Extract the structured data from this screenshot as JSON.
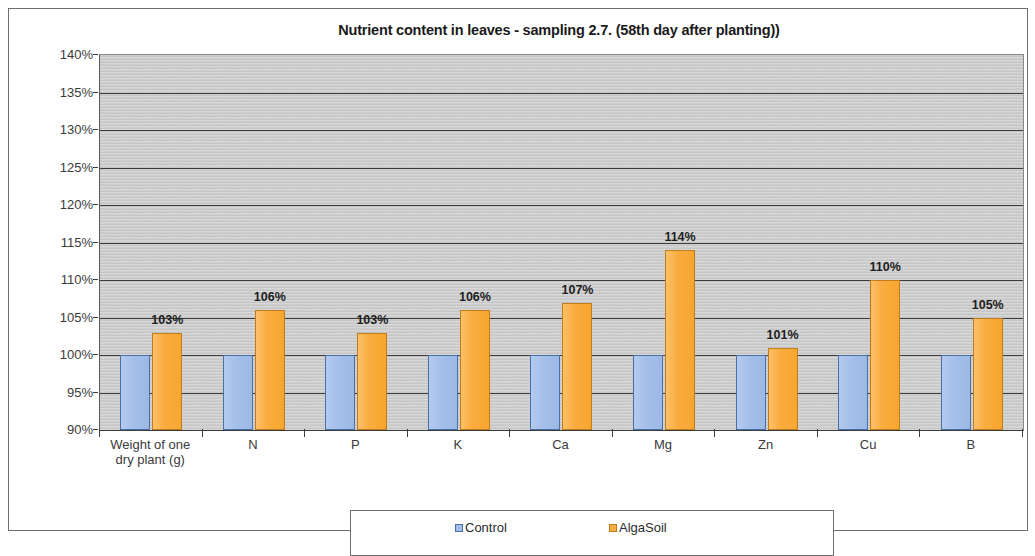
{
  "chart_data": {
    "type": "bar",
    "title": "Nutrient content in leaves - sampling 2.7. (58th day after planting))",
    "xlabel": "",
    "ylabel": "",
    "ylim": [
      90,
      140
    ],
    "ytick_labels": [
      "140%",
      "135%",
      "130%",
      "125%",
      "120%",
      "115%",
      "110%",
      "105%",
      "100%",
      "95%",
      "90%"
    ],
    "ytick_values": [
      140,
      135,
      130,
      125,
      120,
      115,
      110,
      105,
      100,
      95,
      90
    ],
    "grid": true,
    "legend_position": "bottom",
    "categories": [
      "Weight of one\ndry plant (g)",
      "N",
      "P",
      "K",
      "Ca",
      "Mg",
      "Zn",
      "Cu",
      "B"
    ],
    "category_lines": [
      [
        "Weight of one",
        "dry plant (g)"
      ],
      [
        "N"
      ],
      [
        "P"
      ],
      [
        "K"
      ],
      [
        "Ca"
      ],
      [
        "Mg"
      ],
      [
        "Zn"
      ],
      [
        "Cu"
      ],
      [
        "B"
      ]
    ],
    "series": [
      {
        "name": "Control",
        "color": "#a4bfe9",
        "values": [
          100,
          100,
          100,
          100,
          100,
          100,
          100,
          100,
          100
        ],
        "labels": [
          "",
          "",
          "",
          "",
          "",
          "",
          "",
          "",
          ""
        ]
      },
      {
        "name": "AlgaSoil",
        "color": "#f9ac3f",
        "values": [
          103,
          106,
          103,
          106,
          107,
          114,
          101,
          110,
          105
        ],
        "labels": [
          "103%",
          "106%",
          "103%",
          "106%",
          "107%",
          "114%",
          "101%",
          "110%",
          "105%"
        ]
      }
    ]
  },
  "legend": {
    "entries": [
      {
        "label": "Control",
        "swatch": "control"
      },
      {
        "label": "AlgaSoil",
        "swatch": "algasoil"
      }
    ]
  }
}
